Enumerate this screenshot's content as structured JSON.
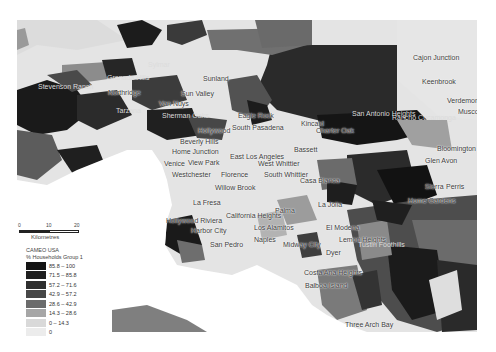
{
  "map": {
    "region": "Los Angeles area",
    "places": [
      {
        "name": "Cajon Junction",
        "x": 413,
        "y": 58,
        "tone": "dark"
      },
      {
        "name": "Keenbrook",
        "x": 422,
        "y": 82,
        "tone": "dark"
      },
      {
        "name": "Verdemont",
        "x": 447,
        "y": 101,
        "tone": "dark"
      },
      {
        "name": "Muscoy",
        "x": 458,
        "y": 112,
        "tone": "dark"
      },
      {
        "name": "Sylmar",
        "x": 148,
        "y": 65,
        "tone": "light"
      },
      {
        "name": "Stevenson Ranch",
        "x": 38,
        "y": 87,
        "tone": "light"
      },
      {
        "name": "Granada Hills",
        "x": 107,
        "y": 78,
        "tone": "light"
      },
      {
        "name": "Northridge",
        "x": 108,
        "y": 93,
        "tone": "dark"
      },
      {
        "name": "Sunland",
        "x": 203,
        "y": 79,
        "tone": "dark"
      },
      {
        "name": "Sun Valley",
        "x": 181,
        "y": 94,
        "tone": "dark"
      },
      {
        "name": "Van Nuys",
        "x": 159,
        "y": 104,
        "tone": "dark"
      },
      {
        "name": "Tarzana",
        "x": 116,
        "y": 111,
        "tone": "light"
      },
      {
        "name": "Sherman Oaks",
        "x": 162,
        "y": 116,
        "tone": "light"
      },
      {
        "name": "Eagle Rock",
        "x": 238,
        "y": 116,
        "tone": "dark"
      },
      {
        "name": "South Pasadena",
        "x": 232,
        "y": 128,
        "tone": "dark"
      },
      {
        "name": "Hollywood",
        "x": 198,
        "y": 131,
        "tone": "dark"
      },
      {
        "name": "Kincaid",
        "x": 301,
        "y": 124,
        "tone": "dark"
      },
      {
        "name": "Charter Oak",
        "x": 316,
        "y": 131,
        "tone": "dark"
      },
      {
        "name": "San Antonio Heights",
        "x": 352,
        "y": 114,
        "tone": "light"
      },
      {
        "name": "Rancho Cucamonga",
        "x": 392,
        "y": 118,
        "tone": "light"
      },
      {
        "name": "Beverly Hills",
        "x": 180,
        "y": 142,
        "tone": "dark"
      },
      {
        "name": "Home Junction",
        "x": 172,
        "y": 152,
        "tone": "dark"
      },
      {
        "name": "Bassett",
        "x": 294,
        "y": 150,
        "tone": "dark"
      },
      {
        "name": "East Los Angeles",
        "x": 230,
        "y": 157,
        "tone": "dark"
      },
      {
        "name": "Bloomington",
        "x": 437,
        "y": 149,
        "tone": "dark"
      },
      {
        "name": "Venice",
        "x": 164,
        "y": 164,
        "tone": "dark"
      },
      {
        "name": "View Park",
        "x": 188,
        "y": 163,
        "tone": "dark"
      },
      {
        "name": "West Whittier",
        "x": 258,
        "y": 164,
        "tone": "dark"
      },
      {
        "name": "Westchester",
        "x": 172,
        "y": 175,
        "tone": "dark"
      },
      {
        "name": "Florence",
        "x": 221,
        "y": 175,
        "tone": "dark"
      },
      {
        "name": "South Whittier",
        "x": 264,
        "y": 175,
        "tone": "dark"
      },
      {
        "name": "Glen Avon",
        "x": 425,
        "y": 161,
        "tone": "dark"
      },
      {
        "name": "Casa Blanca",
        "x": 300,
        "y": 181,
        "tone": "dark"
      },
      {
        "name": "Willow Brook",
        "x": 215,
        "y": 188,
        "tone": "dark"
      },
      {
        "name": "Sierra",
        "x": 425,
        "y": 187,
        "tone": "dark"
      },
      {
        "name": "Perris",
        "x": 446,
        "y": 187,
        "tone": "dark"
      },
      {
        "name": "La Fresa",
        "x": 193,
        "y": 203,
        "tone": "dark"
      },
      {
        "name": "La Jolla",
        "x": 318,
        "y": 205,
        "tone": "dark"
      },
      {
        "name": "Home Gardens",
        "x": 408,
        "y": 201,
        "tone": "dark"
      },
      {
        "name": "Hollywood Riviera",
        "x": 166,
        "y": 221,
        "tone": "dark"
      },
      {
        "name": "California Heights",
        "x": 226,
        "y": 216,
        "tone": "dark"
      },
      {
        "name": "Palma",
        "x": 275,
        "y": 211,
        "tone": "dark"
      },
      {
        "name": "Harbor City",
        "x": 191,
        "y": 231,
        "tone": "dark"
      },
      {
        "name": "Los Alamitos",
        "x": 254,
        "y": 228,
        "tone": "dark"
      },
      {
        "name": "El Modena",
        "x": 326,
        "y": 228,
        "tone": "dark"
      },
      {
        "name": "San Pedro",
        "x": 210,
        "y": 245,
        "tone": "dark"
      },
      {
        "name": "Naples",
        "x": 254,
        "y": 240,
        "tone": "dark"
      },
      {
        "name": "Midway City",
        "x": 283,
        "y": 245,
        "tone": "dark"
      },
      {
        "name": "Lemon Heights",
        "x": 339,
        "y": 240,
        "tone": "dark"
      },
      {
        "name": "Tustin Foothills",
        "x": 358,
        "y": 245,
        "tone": "light"
      },
      {
        "name": "Dyer",
        "x": 326,
        "y": 253,
        "tone": "dark"
      },
      {
        "name": "Costa Ana Heights",
        "x": 304,
        "y": 273,
        "tone": "dark"
      },
      {
        "name": "Balboa Island",
        "x": 305,
        "y": 286,
        "tone": "dark"
      },
      {
        "name": "Three Arch Bay",
        "x": 345,
        "y": 325,
        "tone": "dark"
      }
    ]
  },
  "scale_bar": {
    "ticks": [
      "0",
      "10",
      "20"
    ],
    "unit": "Kilometres"
  },
  "legend": {
    "title": "CAMEO USA",
    "subtitle": "% Households Group 1",
    "classes": [
      {
        "label": "85.8 – 100",
        "color": "#141414"
      },
      {
        "label": "71.5 – 85.8",
        "color": "#1f1f1f"
      },
      {
        "label": "57.2 – 71.6",
        "color": "#2e2e2e"
      },
      {
        "label": "42.9 – 57.2",
        "color": "#474747"
      },
      {
        "label": "28.6 – 42.9",
        "color": "#6b6b6b"
      },
      {
        "label": "14.3 – 28.6",
        "color": "#a6a6a6"
      },
      {
        "label": "0 – 14.3",
        "color": "#d9d9d9"
      },
      {
        "label": "0",
        "color": "#ececec"
      }
    ]
  }
}
